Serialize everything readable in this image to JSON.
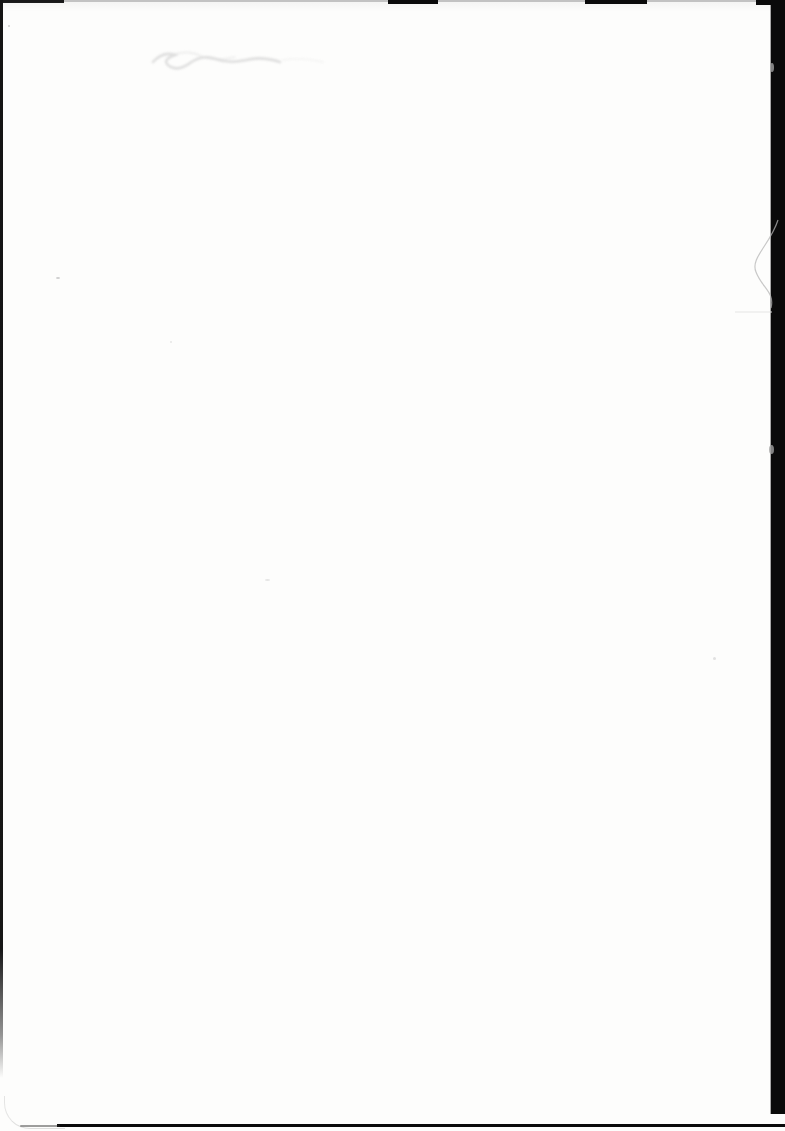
{
  "document": {
    "kind": "scanned blank page",
    "visible_text": ""
  },
  "colors": {
    "page_background": "#fdfdfc",
    "scan_border": "#0a0a0a",
    "pencil_smudge": "#d4d4d4",
    "hairline_scratch": "#b6b6b6",
    "hairline_faint": "#e2e2e2",
    "bar_notch": "#a0a0a0",
    "dust_speck": "#cfcfcf"
  }
}
